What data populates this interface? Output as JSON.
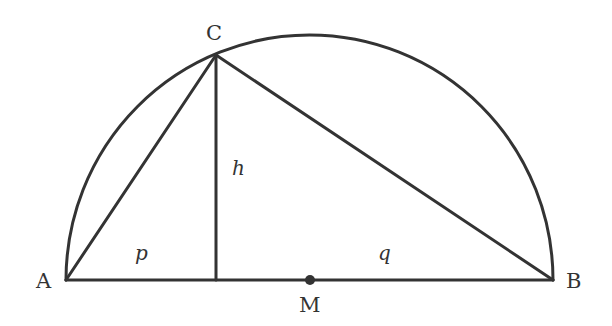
{
  "diagram": {
    "type": "geometry",
    "points": {
      "A": {
        "label": "A",
        "x": 66,
        "y": 280
      },
      "B": {
        "label": "B",
        "x": 553,
        "y": 280
      },
      "C": {
        "label": "C",
        "x": 216,
        "y": 55
      },
      "M": {
        "label": "M",
        "x": 310,
        "y": 280
      },
      "H": {
        "x": 216,
        "y": 280
      }
    },
    "segment_labels": {
      "p": "p",
      "q": "q",
      "h": "h"
    },
    "colors": {
      "stroke": "#333333",
      "background": "#ffffff"
    }
  }
}
